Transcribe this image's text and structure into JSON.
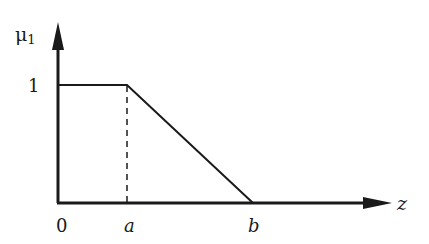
{
  "diagram": {
    "type": "membership-function",
    "y_axis_label": "μ",
    "y_axis_subscript": "1",
    "x_axis_label": "z",
    "y_tick_label": "1",
    "x_tick_labels": {
      "origin": "0",
      "a": "a",
      "b": "b"
    },
    "shape": "trapezoid-left-shoulder: value 1 from 0 to a, decreasing linearly to 0 at b",
    "colors": {
      "stroke": "#1a1a1a",
      "background": "#ffffff"
    }
  }
}
